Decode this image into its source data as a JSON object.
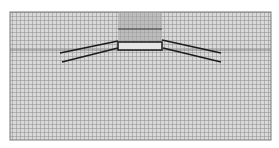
{
  "diagram": {
    "type": "finite-element-mesh",
    "colors": {
      "background": "#ffffff",
      "mesh_fill": "#d9d9d9",
      "grid_line": "#8c8c8c",
      "column_fill": "#a6a6a6",
      "structure_line": "#1a1a1a",
      "plate_fill": "#e6e6e6"
    },
    "mesh": {
      "x": 10,
      "y": 12,
      "width": 261,
      "height": 128,
      "cell": 4
    },
    "column": {
      "x": 118,
      "y": 12,
      "width": 44,
      "height": 30,
      "divider_y": 29
    },
    "plate": {
      "x": 118,
      "y": 42,
      "width": 44,
      "height": 8
    },
    "faint_layer_line_y": 50,
    "inclined_lines": [
      {
        "name": "left-upper",
        "x1": 60,
        "y1": 53,
        "x2": 118,
        "y2": 41
      },
      {
        "name": "left-lower",
        "x1": 62,
        "y1": 62,
        "x2": 118,
        "y2": 48
      },
      {
        "name": "right-upper",
        "x1": 162,
        "y1": 40,
        "x2": 221,
        "y2": 53
      },
      {
        "name": "right-lower",
        "x1": 163,
        "y1": 48,
        "x2": 221,
        "y2": 62
      }
    ]
  }
}
